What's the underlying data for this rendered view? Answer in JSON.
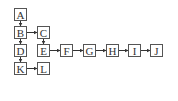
{
  "diagram": {
    "type": "tree-linked-list",
    "colors": {
      "stroke": "#555555",
      "text": "#333333",
      "background": "#ffffff"
    },
    "nodes": [
      {
        "id": "A",
        "label": "A",
        "x": 14,
        "y": 8
      },
      {
        "id": "B",
        "label": "B",
        "x": 14,
        "y": 26
      },
      {
        "id": "C",
        "label": "C",
        "x": 37,
        "y": 26
      },
      {
        "id": "D",
        "label": "D",
        "x": 14,
        "y": 44
      },
      {
        "id": "E",
        "label": "E",
        "x": 37,
        "y": 44
      },
      {
        "id": "F",
        "label": "F",
        "x": 60,
        "y": 44
      },
      {
        "id": "G",
        "label": "G",
        "x": 83,
        "y": 44
      },
      {
        "id": "H",
        "label": "H",
        "x": 106,
        "y": 44
      },
      {
        "id": "I",
        "label": "I",
        "x": 128,
        "y": 44
      },
      {
        "id": "J",
        "label": "J",
        "x": 150,
        "y": 44
      },
      {
        "id": "K",
        "label": "K",
        "x": 14,
        "y": 62
      },
      {
        "id": "L",
        "label": "L",
        "x": 37,
        "y": 62
      }
    ],
    "edges": [
      {
        "from": "A",
        "to": "B",
        "dir": "down"
      },
      {
        "from": "B",
        "to": "C",
        "dir": "right"
      },
      {
        "from": "B",
        "to": "D",
        "dir": "down"
      },
      {
        "from": "C",
        "to": "E",
        "dir": "down"
      },
      {
        "from": "D",
        "to": "K",
        "dir": "down"
      },
      {
        "from": "E",
        "to": "F",
        "dir": "right"
      },
      {
        "from": "F",
        "to": "G",
        "dir": "right"
      },
      {
        "from": "G",
        "to": "H",
        "dir": "right"
      },
      {
        "from": "H",
        "to": "I",
        "dir": "right"
      },
      {
        "from": "I",
        "to": "J",
        "dir": "right"
      },
      {
        "from": "K",
        "to": "L",
        "dir": "right"
      }
    ]
  }
}
